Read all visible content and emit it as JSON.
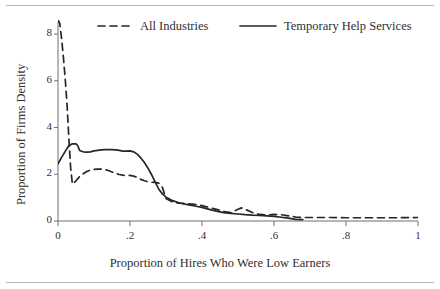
{
  "chart_data": {
    "type": "line",
    "title": "",
    "xlabel": "Proportion of Hires Who Were Low Earners",
    "ylabel": "Proportion of Firms Density",
    "xlim": [
      0,
      1
    ],
    "ylim": [
      0,
      8.6
    ],
    "xticks": [
      "0",
      ".2",
      ".4",
      ".6",
      ".8",
      "1"
    ],
    "xtick_values": [
      0,
      0.2,
      0.4,
      0.6,
      0.8,
      1
    ],
    "yticks": [
      "0",
      "2",
      "4",
      "6",
      "8"
    ],
    "ytick_values": [
      0,
      2,
      4,
      6,
      8
    ],
    "grid": false,
    "legend_position": "top",
    "series": [
      {
        "name": "All Industries",
        "style": "dashed",
        "color": "#262626",
        "x": [
          0.0,
          0.005,
          0.01,
          0.015,
          0.02,
          0.025,
          0.03,
          0.035,
          0.04,
          0.05,
          0.06,
          0.07,
          0.08,
          0.09,
          0.1,
          0.11,
          0.12,
          0.13,
          0.14,
          0.15,
          0.16,
          0.17,
          0.18,
          0.19,
          0.2,
          0.21,
          0.22,
          0.23,
          0.24,
          0.25,
          0.26,
          0.27,
          0.28,
          0.29,
          0.3,
          0.32,
          0.34,
          0.36,
          0.38,
          0.4,
          0.42,
          0.44,
          0.46,
          0.48,
          0.5,
          0.51,
          0.52,
          0.54,
          0.56,
          0.58,
          0.6,
          0.62,
          0.64,
          0.66,
          0.68,
          0.7,
          0.75,
          0.8,
          0.85,
          0.9,
          0.95,
          1.0
        ],
        "y": [
          8.6,
          8.45,
          7.8,
          7.0,
          6.1,
          5.0,
          3.6,
          2.3,
          1.58,
          1.72,
          1.9,
          2.02,
          2.12,
          2.18,
          2.21,
          2.22,
          2.22,
          2.2,
          2.16,
          2.1,
          2.04,
          1.99,
          1.96,
          1.95,
          1.95,
          1.92,
          1.86,
          1.78,
          1.72,
          1.68,
          1.66,
          1.65,
          1.62,
          1.44,
          0.96,
          0.8,
          0.76,
          0.74,
          0.71,
          0.66,
          0.58,
          0.5,
          0.41,
          0.36,
          0.5,
          0.56,
          0.5,
          0.36,
          0.28,
          0.26,
          0.28,
          0.27,
          0.22,
          0.17,
          0.15,
          0.15,
          0.15,
          0.14,
          0.14,
          0.14,
          0.14,
          0.15
        ]
      },
      {
        "name": "Temporary Help Services",
        "style": "solid",
        "color": "#262626",
        "x": [
          0.0,
          0.01,
          0.02,
          0.03,
          0.04,
          0.05,
          0.055,
          0.06,
          0.07,
          0.08,
          0.09,
          0.1,
          0.11,
          0.12,
          0.13,
          0.14,
          0.15,
          0.16,
          0.17,
          0.18,
          0.19,
          0.2,
          0.21,
          0.22,
          0.23,
          0.24,
          0.25,
          0.26,
          0.27,
          0.28,
          0.29,
          0.3,
          0.32,
          0.34,
          0.36,
          0.38,
          0.4,
          0.42,
          0.44,
          0.46,
          0.48,
          0.5,
          0.52,
          0.54,
          0.56,
          0.58,
          0.6,
          0.62,
          0.64,
          0.66,
          0.68
        ],
        "y": [
          2.45,
          2.72,
          2.98,
          3.22,
          3.3,
          3.3,
          3.22,
          3.02,
          2.96,
          2.95,
          2.96,
          3.0,
          3.02,
          3.04,
          3.05,
          3.06,
          3.05,
          3.04,
          3.02,
          2.99,
          2.99,
          3.0,
          2.96,
          2.86,
          2.7,
          2.5,
          2.26,
          1.98,
          1.66,
          1.36,
          1.16,
          1.02,
          0.86,
          0.76,
          0.7,
          0.64,
          0.58,
          0.5,
          0.42,
          0.36,
          0.33,
          0.3,
          0.27,
          0.25,
          0.24,
          0.22,
          0.2,
          0.16,
          0.12,
          0.07,
          0.06
        ]
      }
    ]
  },
  "legend": {
    "entries": [
      {
        "label": "All Industries",
        "style": "dashed"
      },
      {
        "label": "Temporary Help Services",
        "style": "solid"
      }
    ]
  }
}
